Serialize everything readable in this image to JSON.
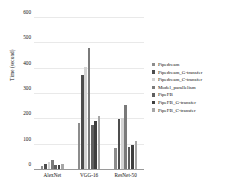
{
  "chart_data": {
    "type": "bar",
    "title": "",
    "xlabel": "",
    "ylabel": "Time (second)",
    "ylim": [
      0,
      600
    ],
    "yticks": [
      0,
      100,
      200,
      300,
      400,
      500,
      600
    ],
    "grid": true,
    "legend_position": "right",
    "categories": [
      "AlexNet",
      "VGG-16",
      "ResNet-50"
    ],
    "series": [
      {
        "name": "Pipedream",
        "color": "#8c8c8c",
        "values": [
          10,
          181,
          82
        ]
      },
      {
        "name": "Pipedream_G-transfer",
        "color": "#4d4d4d",
        "values": [
          18,
          372,
          198
        ]
      },
      {
        "name": "Pipedream_C-transfer",
        "color": "#d4d4d4",
        "values": [
          28,
          406,
          204
        ]
      },
      {
        "name": "Model_parallelism",
        "color": "#7a7a7a",
        "values": [
          36,
          480,
          256
        ]
      },
      {
        "name": "PipeFB",
        "color": "#5f5f5f",
        "values": [
          17,
          175,
          88
        ]
      },
      {
        "name": "PipeFB_G-transfer",
        "color": "#3f3f3f",
        "values": [
          15,
          192,
          94
        ]
      },
      {
        "name": "PipeFB_C-transfer",
        "color": "#a6a6a6",
        "values": [
          20,
          212,
          110
        ]
      }
    ]
  },
  "legend": {
    "items": [
      {
        "label": "Pipedream"
      },
      {
        "label": "Pipedream_G-transfer"
      },
      {
        "label": "Pipedream_C-transfer"
      },
      {
        "label": "Model_parallelism"
      },
      {
        "label": "PipeFB"
      },
      {
        "label": "PipeFB_G-transfer"
      },
      {
        "label": "PipeFB_C-transfer"
      }
    ]
  }
}
